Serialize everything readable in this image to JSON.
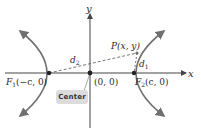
{
  "diagram": {
    "type": "hyperbola",
    "axes": {
      "x_label": "x",
      "y_label": "y"
    },
    "labels": {
      "focus1_name": "F",
      "focus1_sub": "1",
      "focus1_coords": "(−c, 0)",
      "focus2_name": "F",
      "focus2_sub": "2",
      "focus2_coords": "(c, 0)",
      "origin": "(0, 0)",
      "point": "P(x, y)",
      "d1": "d",
      "d1_sub": "1",
      "d2": "d",
      "d2_sub": "2"
    },
    "callout": {
      "label": "Center"
    },
    "colors": {
      "curve": "#707070",
      "axis": "#444444",
      "dashed": "#555555",
      "badge_bg": "#dcdcdc",
      "text": "#2a2a2a"
    }
  }
}
